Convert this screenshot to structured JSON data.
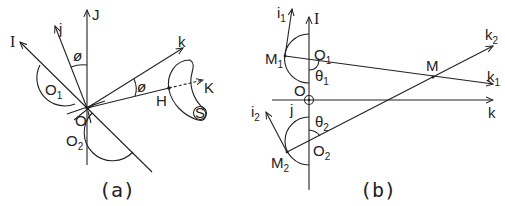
{
  "figure": {
    "panel_a": {
      "caption": "(a)",
      "labels": {
        "I": "I",
        "J": "J",
        "j": "j",
        "k": "k",
        "K": "K",
        "H": "H",
        "O": "O",
        "S": "S",
        "phi_top": "ø",
        "phi_right": "ø",
        "O1": "O",
        "O1_sub": "1",
        "O2": "O",
        "O2_sub": "2"
      }
    },
    "panel_b": {
      "caption": "(b)",
      "labels": {
        "I": "I",
        "i1": "i",
        "i1_sub": "1",
        "i2": "i",
        "i2_sub": "2",
        "M1": "M",
        "M1_sub": "1",
        "M2": "M",
        "M2_sub": "2",
        "M": "M",
        "O": "O",
        "j": "j",
        "O1": "O",
        "O1_sub": "1",
        "O2": "O",
        "O2_sub": "2",
        "theta1": "θ",
        "theta1_sub": "1",
        "theta2": "θ",
        "theta2_sub": "2",
        "k": "k",
        "k1": "k",
        "k1_sub": "1",
        "k2": "k",
        "k2_sub": "2"
      }
    }
  }
}
